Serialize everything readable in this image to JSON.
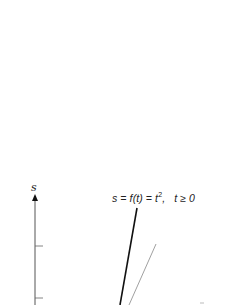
{
  "figure": {
    "axis_label": "s",
    "equation": {
      "lhs": "s = f(t) = t",
      "exponent": "2",
      "condition": ",   t ≥ 0"
    },
    "colors": {
      "background": "#ffffff",
      "axis": "#555555",
      "curve": "#111111",
      "secant": "#888888"
    },
    "axis": {
      "x": 35,
      "top": 196,
      "bottom": 305,
      "ticks_y": [
        246,
        298
      ]
    },
    "lines": [
      {
        "name": "curve",
        "x1": 137,
        "y1": 208,
        "x2": 120,
        "y2": 305,
        "width": 1.6
      },
      {
        "name": "secant-line",
        "x1": 156,
        "y1": 244,
        "x2": 129,
        "y2": 305,
        "width": 0.8
      }
    ]
  }
}
